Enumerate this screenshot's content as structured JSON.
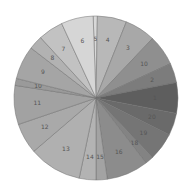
{
  "chart_data": {
    "type": "pie",
    "title": "",
    "center": [
      96,
      98
    ],
    "radius": 82,
    "start_angle_deg": -92,
    "slices": [
      {
        "label": "5",
        "value": 3,
        "color": "#d8d8d8"
      },
      {
        "label": "4",
        "value": 21,
        "color": "#b8b8b8"
      },
      {
        "label": "3",
        "value": 22,
        "color": "#a8a8a8"
      },
      {
        "label": "10",
        "value": 22,
        "color": "#8f8f8f"
      },
      {
        "label": "2",
        "value": 14,
        "color": "#7c7c7c"
      },
      {
        "label": "1",
        "value": 22,
        "color": "#5e5e5e"
      },
      {
        "label": "20",
        "value": 16,
        "color": "#6a6a6a"
      },
      {
        "label": "19",
        "value": 20,
        "color": "#757575"
      },
      {
        "label": "18",
        "value": 6,
        "color": "#838383"
      },
      {
        "label": "16",
        "value": 30,
        "color": "#8c8c8c"
      },
      {
        "label": "15",
        "value": 8,
        "color": "#a3a3a3"
      },
      {
        "label": "14",
        "value": 12,
        "color": "#b3b3b3"
      },
      {
        "label": "13",
        "value": 38,
        "color": "#b0b0b0"
      },
      {
        "label": "12",
        "value": 22,
        "color": "#a9a9a9"
      },
      {
        "label": "11",
        "value": 28,
        "color": "#a2a2a2"
      },
      {
        "label": "10b",
        "value": 5,
        "color": "#9a9a9a"
      },
      {
        "label": "9",
        "value": 24,
        "color": "#a5a5a5"
      },
      {
        "label": "8",
        "value": 10,
        "color": "#b2b2b2"
      },
      {
        "label": "7",
        "value": 18,
        "color": "#c2c2c2"
      },
      {
        "label": "6",
        "value": 23,
        "color": "#d6d6d6"
      }
    ],
    "legend": "none",
    "grid": false
  }
}
